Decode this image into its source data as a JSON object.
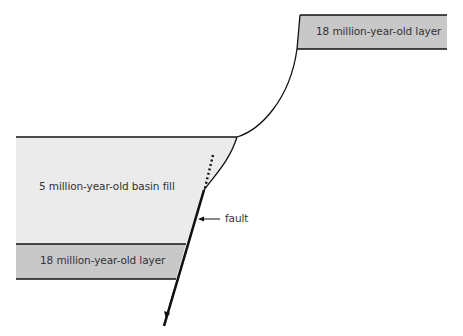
{
  "diagram": {
    "type": "geologic-cross-section",
    "labels": {
      "top_layer": "18 million-year-old layer",
      "basin_fill": "5 million-year-old basin fill",
      "bottom_layer": "18 million-year-old layer",
      "fault": "fault"
    },
    "colors": {
      "old_layer_fill": "#c8c8c8",
      "basin_fill": "#ebebeb",
      "line": "#111111",
      "background": "#ffffff"
    },
    "annotations": {
      "fault_arrow": "arrow pointing left to fault line",
      "motion_arrow": "arrow pointing down-left indicating hanging wall motion",
      "dotted_projection": "dotted line projecting fault upward"
    }
  }
}
